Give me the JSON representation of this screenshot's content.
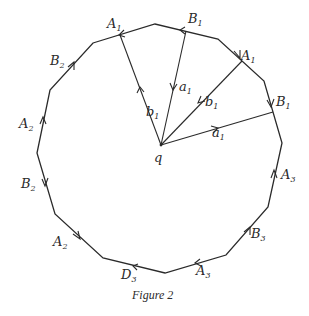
{
  "figure": {
    "caption": "Figure 2",
    "center_label": "q",
    "stroke_color": "#2a2a2a",
    "background": "#ffffff",
    "polygon_vertices": [
      [
        93,
        43
      ],
      [
        155,
        24
      ],
      [
        218,
        39
      ],
      [
        264,
        81
      ],
      [
        282,
        143
      ],
      [
        268,
        207
      ],
      [
        226,
        255
      ],
      [
        165,
        273
      ],
      [
        103,
        258
      ],
      [
        55,
        214
      ],
      [
        37,
        153
      ],
      [
        50,
        90
      ]
    ],
    "edge_labels": [
      {
        "id": "A1-top",
        "letter": "A",
        "sub": "1",
        "x": 107,
        "y": 28
      },
      {
        "id": "B1-top",
        "letter": "B",
        "sub": "1",
        "x": 188,
        "y": 23
      },
      {
        "id": "A1-right",
        "letter": "A",
        "sub": "1",
        "x": 241,
        "y": 60
      },
      {
        "id": "B1-right",
        "letter": "B",
        "sub": "1",
        "x": 276,
        "y": 106
      },
      {
        "id": "A3-right",
        "letter": "A",
        "sub": "3",
        "x": 281,
        "y": 179
      },
      {
        "id": "B3",
        "letter": "B",
        "sub": "3",
        "x": 251,
        "y": 238
      },
      {
        "id": "A3-bottom",
        "letter": "A",
        "sub": "3",
        "x": 196,
        "y": 275
      },
      {
        "id": "D3",
        "letter": "D",
        "sub": "3",
        "x": 121,
        "y": 279
      },
      {
        "id": "A2-lower",
        "letter": "A",
        "sub": "2",
        "x": 53,
        "y": 246
      },
      {
        "id": "B2-lower",
        "letter": "B",
        "sub": "2",
        "x": 21,
        "y": 188
      },
      {
        "id": "A2-upper",
        "letter": "A",
        "sub": "2",
        "x": 19,
        "y": 128
      },
      {
        "id": "B2-upper",
        "letter": "B",
        "sub": "2",
        "x": 50,
        "y": 65
      }
    ],
    "ray_labels": [
      {
        "id": "b1-left",
        "letter": "b",
        "sub": "1",
        "x": 146,
        "y": 116
      },
      {
        "id": "a1-mid",
        "letter": "a",
        "sub": "1",
        "x": 179,
        "y": 91
      },
      {
        "id": "b1-right",
        "letter": "b",
        "sub": "1",
        "x": 205,
        "y": 106
      },
      {
        "id": "a1-right",
        "letter": "a",
        "sub": "1",
        "x": 212,
        "y": 137
      }
    ]
  }
}
